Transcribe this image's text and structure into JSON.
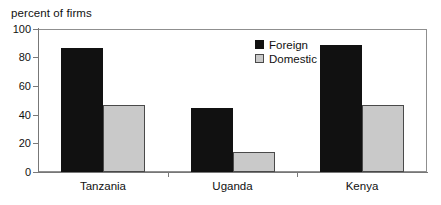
{
  "chart_data": {
    "type": "bar",
    "title": "percent of firms",
    "xlabel": "",
    "ylabel": "percent of firms",
    "categories": [
      "Tanzania",
      "Uganda",
      "Kenya"
    ],
    "series": [
      {
        "name": "Foreign",
        "values": [
          87,
          45,
          89
        ],
        "color": "#111111"
      },
      {
        "name": "Domestic",
        "values": [
          47,
          14,
          47
        ],
        "color": "#c9c9c9"
      }
    ],
    "ylim": [
      0,
      100
    ],
    "yticks": [
      0,
      20,
      40,
      60,
      80,
      100
    ],
    "ytick_labels": [
      "0",
      "20",
      "40",
      "60",
      "80",
      "100"
    ],
    "grid": false,
    "legend_position": "inside upper center-right",
    "legend_entries": [
      "Foreign",
      "Domestic"
    ],
    "bar_style": "grouped"
  },
  "colors": {
    "foreign": "#111111",
    "domestic": "#c9c9c9",
    "axis": "#7a7a7a",
    "frame": "#8f8f8f",
    "text": "#111111",
    "background": "#ffffff"
  }
}
